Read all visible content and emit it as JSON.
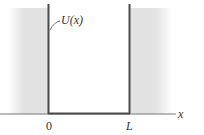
{
  "diagram": {
    "curve_label": "U(x)",
    "axis_label": "x",
    "tick_labels": [
      "0",
      "L"
    ],
    "colors": {
      "wall": "#4a4a4a",
      "shade": "#e2e2e2",
      "axis": "#666666"
    }
  }
}
